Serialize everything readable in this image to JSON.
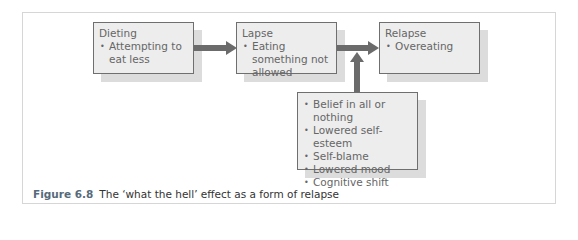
{
  "diagram": {
    "boxes": [
      {
        "id": "dieting",
        "title": "Dieting",
        "items": [
          "Attempting to eat less"
        ]
      },
      {
        "id": "lapse",
        "title": "Lapse",
        "items": [
          "Eating something not allowed"
        ]
      },
      {
        "id": "relapse",
        "title": "Relapse",
        "items": [
          "Overeating"
        ]
      },
      {
        "id": "factors",
        "title": "",
        "items": [
          "Belief in all or nothing",
          "Lowered self-esteem",
          "Self-blame",
          "Lowered mood",
          "Cognitive shift"
        ]
      }
    ],
    "edges": [
      {
        "from": "dieting",
        "to": "lapse"
      },
      {
        "from": "lapse",
        "to": "relapse"
      },
      {
        "from": "factors",
        "to": "lapse-relapse-edge"
      }
    ],
    "colors": {
      "box_fill": "#ededed",
      "box_border": "#6f6f6f",
      "shadow": "#dcdcdc",
      "arrow": "#6b6b6b",
      "caption_label": "#566a7a"
    }
  },
  "caption": {
    "label": "Figure 6.8",
    "text": "The ‘what the hell’ effect as a form of relapse"
  }
}
